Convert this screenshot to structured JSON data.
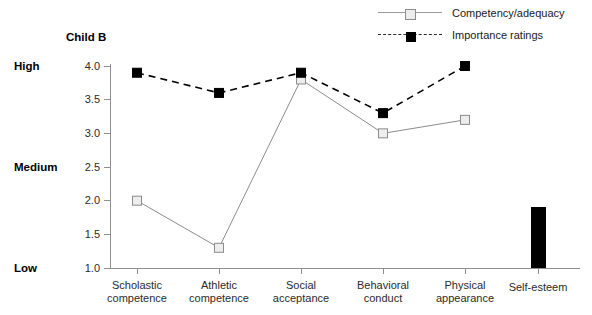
{
  "chart": {
    "title": "Child B",
    "legend": {
      "position": "top-right",
      "entries": [
        {
          "label": "Competency/adequacy",
          "marker": "open-square",
          "line": "solid",
          "color": "#9a9a9a"
        },
        {
          "label": "Importance ratings",
          "marker": "filled-square",
          "line": "dashed",
          "color": "#000000"
        }
      ]
    },
    "anchors": [
      {
        "label": "High",
        "value": 4.0
      },
      {
        "label": "Medium",
        "value": 2.5
      },
      {
        "label": "Low",
        "value": 1.0
      }
    ],
    "yticks": [
      "1.0",
      "1.5",
      "2.0",
      "2.5",
      "3.0",
      "3.5",
      "4.0"
    ]
  },
  "chart_data": {
    "type": "line",
    "title": "Child B",
    "xlabel": "",
    "ylabel": "",
    "ylim": [
      1.0,
      4.0
    ],
    "ytick_values": [
      1.0,
      1.5,
      2.0,
      2.5,
      3.0,
      3.5,
      4.0
    ],
    "grid": false,
    "legend_position": "top-right",
    "categories": [
      "Scholastic competence",
      "Athletic competence",
      "Social acceptance",
      "Behavioral conduct",
      "Physical appearance"
    ],
    "series": [
      {
        "name": "Competency/adequacy",
        "marker": "open-square",
        "linestyle": "solid",
        "color": "#8c8c8c",
        "values": [
          2.0,
          1.3,
          3.8,
          3.0,
          3.2
        ]
      },
      {
        "name": "Importance ratings",
        "marker": "filled-square",
        "linestyle": "dashed",
        "color": "#000000",
        "values": [
          3.9,
          3.6,
          3.9,
          3.3,
          4.0
        ]
      }
    ],
    "extra_bar": {
      "type": "bar",
      "category": "Self-esteem",
      "value": 1.9,
      "color": "#000000"
    },
    "annotations": [
      "High = 4.0",
      "Medium = 2.5",
      "Low = 1.0"
    ]
  }
}
